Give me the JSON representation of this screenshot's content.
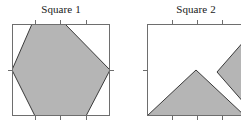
{
  "figure": {
    "width": 241,
    "height": 129,
    "background_color": "#ffffff"
  },
  "style": {
    "fill_color": "#b5b5b5",
    "polygon_outline_color": "#3a3a3a",
    "frame_color": "#6e6e6e",
    "tick_color": "#6e6e6e",
    "title_color": "#1a1a1a"
  },
  "panels": [
    {
      "id": "square-1",
      "title": "Square 1",
      "frame": {
        "x": 12,
        "y": 24,
        "width": 98,
        "height": 92
      },
      "ticks": {
        "top": [
          35,
          60,
          86
        ],
        "bottom": [
          35,
          60,
          86
        ],
        "left": [
          70
        ],
        "right": [
          70
        ]
      },
      "shapes": [
        {
          "name": "shaded-polygon-1",
          "type": "polygon",
          "points": "32,24 65,24 110,70 86,116 35,116 12,70"
        }
      ]
    },
    {
      "id": "square-2",
      "title": "Square 2",
      "frame": {
        "x": 147,
        "y": 24,
        "width": 98,
        "height": 92
      },
      "ticks": {
        "top": [
          172,
          197,
          222
        ],
        "bottom": [
          172,
          197,
          222
        ],
        "left": [
          70
        ],
        "right": [
          70
        ]
      },
      "shapes": [
        {
          "name": "shaded-triangle-2",
          "type": "polygon",
          "points": "147,116 196,70 245,116"
        },
        {
          "name": "shaded-wedge-2",
          "type": "polygon",
          "points": "245,40 217,72 245,104"
        }
      ]
    }
  ]
}
